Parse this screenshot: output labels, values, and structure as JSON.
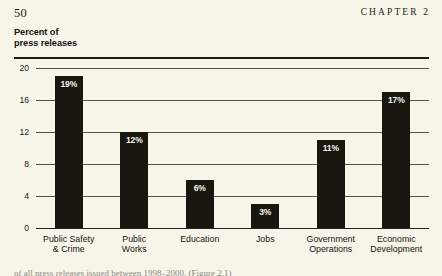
{
  "page": {
    "number": "50",
    "chapter": "CHAPTER 2",
    "background_color": "#f7f5ea",
    "bar_color": "#191610",
    "value_label_color": "#f6f4ea"
  },
  "axis_title": {
    "line1": "Percent of",
    "line2": "press releases"
  },
  "caption": {
    "text": "of all press releases issued between 1998–2000. (Figure 2.1)"
  },
  "chart_data": {
    "type": "bar",
    "title": "",
    "subtitle": "",
    "xlabel": "",
    "ylabel": "Percent of press releases",
    "ylim": [
      0,
      20
    ],
    "yticks": [
      0,
      4,
      8,
      12,
      16,
      20
    ],
    "ytick_labels": [
      "0",
      "4",
      "8",
      "12",
      "16",
      "20"
    ],
    "grid": true,
    "legend": false,
    "categories": [
      "Public Safety\n& Crime",
      "Public\nWorks",
      "Education",
      "Jobs",
      "Government\nOperations",
      "Economic\nDevelopment"
    ],
    "category_lines": [
      [
        "Public Safety",
        "& Crime"
      ],
      [
        "Public",
        "Works"
      ],
      [
        "Education",
        ""
      ],
      [
        "Jobs",
        ""
      ],
      [
        "Government",
        "Operations"
      ],
      [
        "Economic",
        "Development"
      ]
    ],
    "values": [
      19,
      12,
      6,
      3,
      11,
      17
    ],
    "data_labels": [
      "19%",
      "12%",
      "6%",
      "3%",
      "11%",
      "17%"
    ]
  }
}
